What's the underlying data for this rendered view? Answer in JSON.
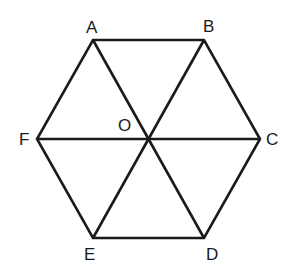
{
  "diagram": {
    "type": "regular hexagon with center",
    "stroke_color": "#1a1a1a",
    "background": "#ffffff",
    "vertices": {
      "A": {
        "label": "A",
        "x": 93,
        "y": 40
      },
      "B": {
        "label": "B",
        "x": 204,
        "y": 40
      },
      "C": {
        "label": "C",
        "x": 260,
        "y": 139
      },
      "D": {
        "label": "D",
        "x": 204,
        "y": 238
      },
      "E": {
        "label": "E",
        "x": 93,
        "y": 238
      },
      "F": {
        "label": "F",
        "x": 37,
        "y": 139
      },
      "O": {
        "label": "O",
        "x": 148,
        "y": 139
      }
    },
    "edges": [
      [
        "A",
        "B"
      ],
      [
        "B",
        "C"
      ],
      [
        "C",
        "D"
      ],
      [
        "D",
        "E"
      ],
      [
        "E",
        "F"
      ],
      [
        "F",
        "A"
      ],
      [
        "A",
        "D"
      ],
      [
        "B",
        "E"
      ],
      [
        "F",
        "C"
      ]
    ]
  }
}
